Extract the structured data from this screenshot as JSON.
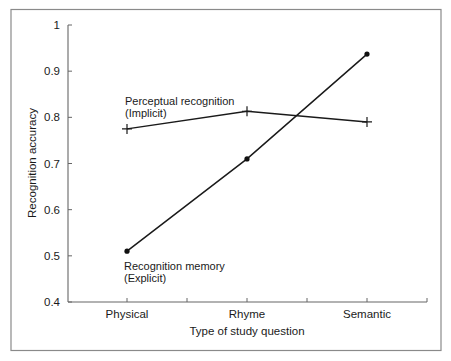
{
  "chart_data": {
    "type": "line",
    "title": "",
    "xlabel": "Type of study question",
    "ylabel": "Recognition accuracy",
    "categories": [
      "Physical",
      "Rhyme",
      "Semantic"
    ],
    "ylim": [
      0.4,
      1.0
    ],
    "yticks": [
      0.4,
      0.5,
      0.6,
      0.7,
      0.8,
      0.9,
      1
    ],
    "ytick_labels": [
      "0.4",
      "0.5",
      "0.6",
      "0.7",
      "0.8",
      "0.9",
      "1"
    ],
    "grid": false,
    "legend": "inline labels",
    "series": [
      {
        "name": "Perceptual recognition (Implicit)",
        "label_line1": "Perceptual recognition",
        "label_line2": "(Implicit)",
        "marker": "plus",
        "values": [
          0.775,
          0.813,
          0.79
        ]
      },
      {
        "name": "Recognition memory (Explicit)",
        "label_line1": "Recognition memory",
        "label_line2": "(Explicit)",
        "marker": "dot",
        "values": [
          0.51,
          0.71,
          0.937
        ]
      }
    ]
  }
}
